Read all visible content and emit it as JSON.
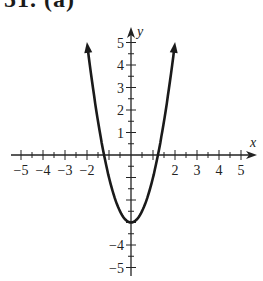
{
  "header": {
    "label": "51. (a)"
  },
  "chart_data": {
    "type": "line",
    "title": "",
    "function": "y = 2x^2 - 3",
    "xlabel": "x",
    "ylabel": "y",
    "xlim": [
      -5,
      5
    ],
    "ylim": [
      -5,
      5
    ],
    "x_ticks": [
      -5,
      -4,
      -3,
      -2,
      2,
      3,
      4,
      5
    ],
    "y_ticks": [
      5,
      4,
      3,
      2,
      1,
      -4,
      -5
    ],
    "minor_tick_step": 0.5,
    "grid": false,
    "series": [
      {
        "name": "parabola",
        "x": [
          -2,
          -1.5,
          -1.22,
          -1,
          -0.5,
          0,
          0.5,
          1,
          1.22,
          1.5,
          2
        ],
        "y": [
          5,
          1.5,
          0,
          -1,
          -2.5,
          -3,
          -2.5,
          -1,
          0,
          1.5,
          5
        ]
      }
    ],
    "vertex": [
      0,
      -3
    ],
    "x_intercepts": [
      -1.22,
      1.22
    ],
    "annotations": [
      "arrows at both ends of curve"
    ]
  },
  "colors": {
    "curve": "#1a1a1a",
    "axes": "#222222",
    "background": "#ffffff"
  }
}
